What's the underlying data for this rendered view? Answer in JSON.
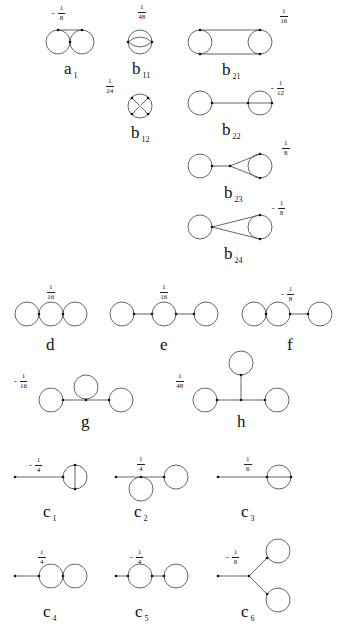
{
  "diagrams": [
    {
      "id": "a1",
      "base": "a",
      "sub": "1",
      "coef": {
        "sign": "-",
        "num": "1",
        "den": "8"
      }
    },
    {
      "id": "b11",
      "base": "b",
      "sub": "11",
      "coef": {
        "sign": "",
        "num": "1",
        "den": "48"
      }
    },
    {
      "id": "b12",
      "base": "b",
      "sub": "12",
      "coef": {
        "sign": "",
        "num": "1",
        "den": "24"
      }
    },
    {
      "id": "b21",
      "base": "b",
      "sub": "21",
      "coef": {
        "sign": "",
        "num": "1",
        "den": "16"
      }
    },
    {
      "id": "b22",
      "base": "b",
      "sub": "22",
      "coef": {
        "sign": "-",
        "num": "1",
        "den": "12"
      }
    },
    {
      "id": "b23",
      "base": "b",
      "sub": "23",
      "coef": {
        "sign": "",
        "num": "1",
        "den": "8"
      }
    },
    {
      "id": "b24",
      "base": "b",
      "sub": "24",
      "coef": {
        "sign": "-",
        "num": "1",
        "den": "8"
      }
    },
    {
      "id": "d",
      "base": "d",
      "sub": "",
      "coef": {
        "sign": "",
        "num": "1",
        "den": "16"
      }
    },
    {
      "id": "e",
      "base": "e",
      "sub": "",
      "coef": {
        "sign": "",
        "num": "1",
        "den": "16"
      }
    },
    {
      "id": "f",
      "base": "f",
      "sub": "",
      "coef": {
        "sign": "-",
        "num": "1",
        "den": "8"
      }
    },
    {
      "id": "g",
      "base": "g",
      "sub": "",
      "coef": {
        "sign": "-",
        "num": "1",
        "den": "16"
      }
    },
    {
      "id": "h",
      "base": "h",
      "sub": "",
      "coef": {
        "sign": "",
        "num": "1",
        "den": "48"
      }
    },
    {
      "id": "c1",
      "base": "c",
      "sub": "1",
      "coef": {
        "sign": "-",
        "num": "1",
        "den": "4"
      }
    },
    {
      "id": "c2",
      "base": "c",
      "sub": "2",
      "coef": {
        "sign": "",
        "num": "1",
        "den": "4"
      }
    },
    {
      "id": "c3",
      "base": "c",
      "sub": "3",
      "coef": {
        "sign": "",
        "num": "1",
        "den": "6"
      }
    },
    {
      "id": "c4",
      "base": "c",
      "sub": "4",
      "coef": {
        "sign": "",
        "num": "1",
        "den": "4"
      }
    },
    {
      "id": "c5",
      "base": "c",
      "sub": "5",
      "coef": {
        "sign": "-",
        "num": "1",
        "den": "4"
      }
    },
    {
      "id": "c6",
      "base": "c",
      "sub": "6",
      "coef": {
        "sign": "-",
        "num": "1",
        "den": "8"
      }
    }
  ],
  "colors": {
    "stroke": "#555555",
    "vertex": "#111111",
    "text": "#111111"
  }
}
